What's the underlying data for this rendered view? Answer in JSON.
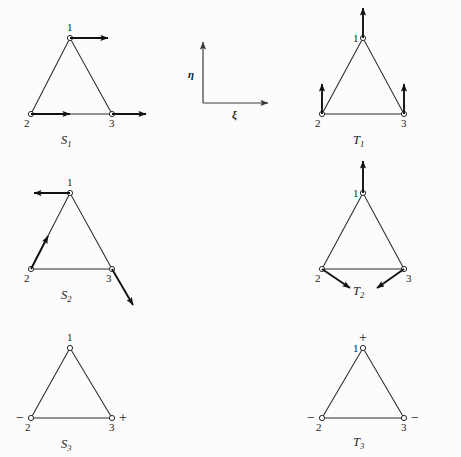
{
  "figure": {
    "background_color": "#fcfcfc",
    "ink_color": "#1a1a1a"
  },
  "axes": {
    "vertical_label": "η",
    "horizontal_label": "ξ"
  },
  "node_labels": {
    "n1": "1",
    "n2": "2",
    "n3": "3"
  },
  "signs": {
    "plus": "+",
    "minus": "−"
  },
  "panels": [
    {
      "id": "s1",
      "caption_base": "S",
      "caption_sub": "1",
      "caption": "S1",
      "annotation_type": "arrows",
      "arrows": [
        {
          "at_node": "1",
          "direction": "right"
        },
        {
          "at_node": "2",
          "direction": "right"
        },
        {
          "at_node": "3",
          "direction": "right"
        }
      ]
    },
    {
      "id": "t1",
      "caption_base": "T",
      "caption_sub": "1",
      "caption": "T1",
      "annotation_type": "arrows",
      "arrows": [
        {
          "at_node": "1",
          "direction": "up"
        },
        {
          "at_node": "2",
          "direction": "up"
        },
        {
          "at_node": "3",
          "direction": "up"
        }
      ]
    },
    {
      "id": "s2",
      "caption_base": "S",
      "caption_sub": "2",
      "caption": "S2",
      "annotation_type": "arrows",
      "arrows": [
        {
          "at_node": "1",
          "direction": "left"
        },
        {
          "at_node": "2",
          "direction": "up-right-diagonal"
        },
        {
          "at_node": "3",
          "direction": "down-right-diagonal"
        }
      ]
    },
    {
      "id": "t2",
      "caption_base": "T",
      "caption_sub": "2",
      "caption": "T2",
      "annotation_type": "arrows",
      "arrows": [
        {
          "at_node": "1",
          "direction": "up"
        },
        {
          "at_node": "2",
          "direction": "down-right-diagonal"
        },
        {
          "at_node": "3",
          "direction": "down-left-diagonal"
        }
      ]
    },
    {
      "id": "s3",
      "caption_base": "S",
      "caption_sub": "3",
      "caption": "S3",
      "annotation_type": "signs",
      "sign_marks": [
        {
          "at_node": "2",
          "sign": "−",
          "position": "left"
        },
        {
          "at_node": "3",
          "sign": "+",
          "position": "right"
        }
      ]
    },
    {
      "id": "t3",
      "caption_base": "T",
      "caption_sub": "3",
      "caption": "T3",
      "annotation_type": "signs",
      "sign_marks": [
        {
          "at_node": "1",
          "sign": "+",
          "position": "above"
        },
        {
          "at_node": "2",
          "sign": "−",
          "position": "left"
        },
        {
          "at_node": "3",
          "sign": "−",
          "position": "right"
        }
      ]
    }
  ]
}
